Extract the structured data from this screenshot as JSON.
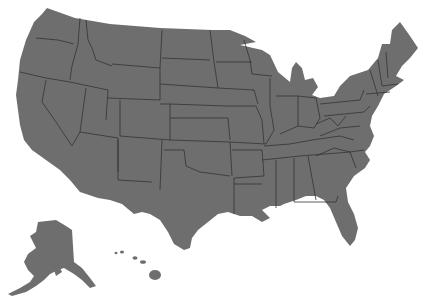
{
  "map": {
    "title": "",
    "subject": "United States (50 states)",
    "colors": {
      "fill": "#6e6e6e",
      "border": "#333333",
      "background": "#ffffff"
    },
    "regions": [
      "Contiguous United States",
      "Alaska",
      "Hawaii"
    ]
  }
}
